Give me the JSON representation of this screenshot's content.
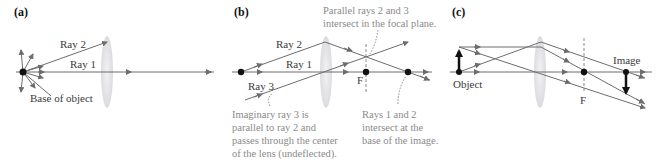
{
  "panels": [
    {
      "id": "a",
      "label": "(a)",
      "texts": {
        "ray2": "Ray 2",
        "ray1": "Ray 1",
        "base": "Base of object"
      }
    },
    {
      "id": "b",
      "label": "(b)",
      "texts": {
        "ray2": "Ray 2",
        "ray1": "Ray 1",
        "ray3": "Ray 3",
        "focal": "F",
        "note_top": [
          "Parallel rays 2 and 3",
          "intersect in the focal plane."
        ],
        "note_left": [
          "Imaginary ray 3 is",
          "parallel to ray 2 and",
          "passes through the center",
          "of the lens (undeflected)."
        ],
        "note_right": [
          "Rays 1 and 2",
          "intersect at the",
          "base of the image."
        ]
      }
    },
    {
      "id": "c",
      "label": "(c)",
      "texts": {
        "object": "Object",
        "image": "Image",
        "focal": "F"
      }
    }
  ],
  "colors": {
    "ray": "#6d6d6d",
    "lens": "#e6e6ea",
    "note": "#8a8a8a",
    "point": "#111111"
  }
}
